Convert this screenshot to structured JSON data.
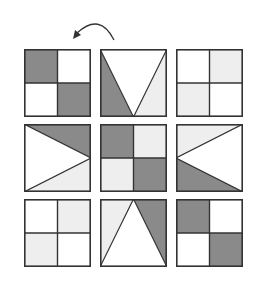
{
  "colors": {
    "dark": "#8a8a8a",
    "light": "#eeeeee",
    "white": "#ffffff",
    "stroke": "#333333"
  },
  "arrow": {
    "direction": "counter-clockwise",
    "icon": "curved-arrow-icon"
  },
  "grid": {
    "rows": 3,
    "cols": 3,
    "cells": [
      {
        "row": 0,
        "col": 0,
        "pattern": "quadrants",
        "fills": [
          "dark",
          "white",
          "white",
          "dark"
        ]
      },
      {
        "row": 0,
        "col": 1,
        "pattern": "triangle-down",
        "fills": [
          "dark",
          "white",
          "light"
        ]
      },
      {
        "row": 0,
        "col": 2,
        "pattern": "quadrants",
        "fills": [
          "white",
          "light",
          "light",
          "white"
        ]
      },
      {
        "row": 1,
        "col": 0,
        "pattern": "triangle-right",
        "fills": [
          "dark",
          "white",
          "light"
        ]
      },
      {
        "row": 1,
        "col": 1,
        "pattern": "quadrants",
        "fills": [
          "dark",
          "light",
          "light",
          "dark"
        ]
      },
      {
        "row": 1,
        "col": 2,
        "pattern": "triangle-left",
        "fills": [
          "light",
          "white",
          "dark"
        ]
      },
      {
        "row": 2,
        "col": 0,
        "pattern": "quadrants",
        "fills": [
          "white",
          "light",
          "light",
          "white"
        ]
      },
      {
        "row": 2,
        "col": 1,
        "pattern": "triangle-up",
        "fills": [
          "light",
          "white",
          "dark"
        ]
      },
      {
        "row": 2,
        "col": 2,
        "pattern": "quadrants",
        "fills": [
          "dark",
          "white",
          "white",
          "dark"
        ]
      }
    ]
  }
}
